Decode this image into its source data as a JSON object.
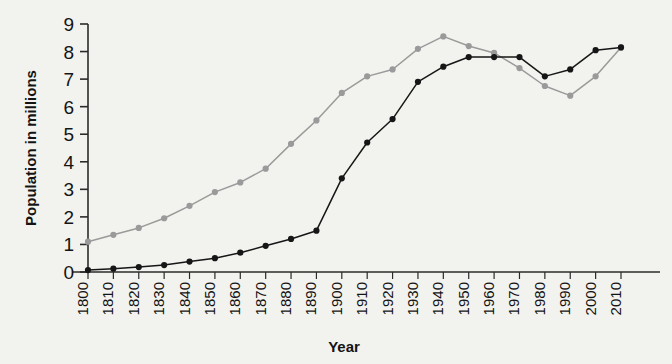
{
  "chart_data": {
    "type": "line",
    "title": "",
    "xlabel": "Year",
    "ylabel": "Population in millions",
    "x": [
      1800,
      1810,
      1820,
      1830,
      1840,
      1850,
      1860,
      1870,
      1880,
      1890,
      1900,
      1910,
      1920,
      1930,
      1940,
      1950,
      1960,
      1970,
      1980,
      1990,
      2000,
      2010
    ],
    "categories": [
      "1800",
      "1810",
      "1820",
      "1830",
      "1840",
      "1850",
      "1860",
      "1870",
      "1880",
      "1890",
      "1900",
      "1910",
      "1920",
      "1930",
      "1940",
      "1950",
      "1960",
      "1970",
      "1980",
      "1990",
      "2000",
      "2010"
    ],
    "xlim": [
      1800,
      2010
    ],
    "ylim": [
      0,
      9
    ],
    "yticks": [
      0,
      1,
      2,
      3,
      4,
      5,
      6,
      7,
      8,
      9
    ],
    "ytick_labels": [
      "0",
      "1",
      "2",
      "3",
      "4",
      "5",
      "6",
      "7",
      "8",
      "9"
    ],
    "grid": false,
    "legend": "none",
    "series": [
      {
        "name": "series-gray",
        "color": "#9a9a9a",
        "marker": "circle",
        "values": [
          1.1,
          1.35,
          1.6,
          1.95,
          2.4,
          2.9,
          3.25,
          3.75,
          4.65,
          5.5,
          6.5,
          7.1,
          7.35,
          8.1,
          8.55,
          8.2,
          7.95,
          7.4,
          6.75,
          6.4,
          7.1,
          8.15
        ]
      },
      {
        "name": "series-black",
        "color": "#161616",
        "marker": "circle",
        "values": [
          0.07,
          0.12,
          0.18,
          0.25,
          0.38,
          0.5,
          0.7,
          0.95,
          1.2,
          1.5,
          3.4,
          4.7,
          5.55,
          6.9,
          7.45,
          7.8,
          7.8,
          7.8,
          7.1,
          7.35,
          8.05,
          8.15
        ]
      }
    ]
  },
  "axes": {
    "y_title": "Population in millions",
    "x_title": "Year"
  }
}
